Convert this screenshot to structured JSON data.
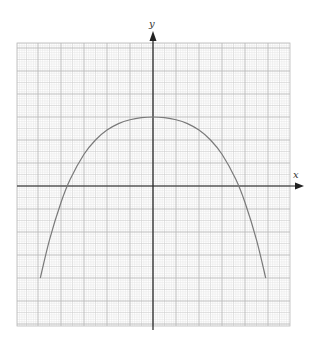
{
  "chart_data": {
    "type": "line",
    "title": "",
    "xlabel": "x",
    "ylabel": "y",
    "xlim": [
      -6,
      6
    ],
    "ylim": [
      -6,
      6
    ],
    "grid": true,
    "grid_minor_per_unit": 10,
    "legend": "none",
    "tick_labels": false,
    "series": [
      {
        "name": "curve",
        "color": "#7a7a7a",
        "x": [
          -4.9,
          -4.5,
          -4.0,
          -3.6,
          -3.0,
          -2.5,
          -2.0,
          -1.5,
          -1.0,
          -0.5,
          0,
          0.5,
          1.0,
          1.5,
          2.0,
          2.5,
          3.0,
          3.6,
          4.0,
          4.5,
          4.9
        ],
        "y": [
          -4.0,
          -2.34,
          -0.72,
          0.29,
          1.38,
          2.0,
          2.43,
          2.71,
          2.88,
          2.97,
          3.0,
          2.97,
          2.88,
          2.71,
          2.43,
          2.0,
          1.38,
          0.29,
          -0.72,
          -2.34,
          -4.0
        ]
      }
    ],
    "annotations": {
      "vertex": [
        0,
        3
      ],
      "x_intercepts": [
        -3.6,
        3.6
      ],
      "endpoints": [
        [
          -4.9,
          -4.0
        ],
        [
          4.9,
          -4.0
        ]
      ]
    }
  },
  "labels": {
    "x_axis": "x",
    "y_axis": "y"
  },
  "colors": {
    "axis": "#222222",
    "grid_major": "#b8b8b8",
    "grid_mid": "#cfcfcf",
    "grid_minor": "#e4e4e4",
    "curve": "#7a7a7a"
  }
}
